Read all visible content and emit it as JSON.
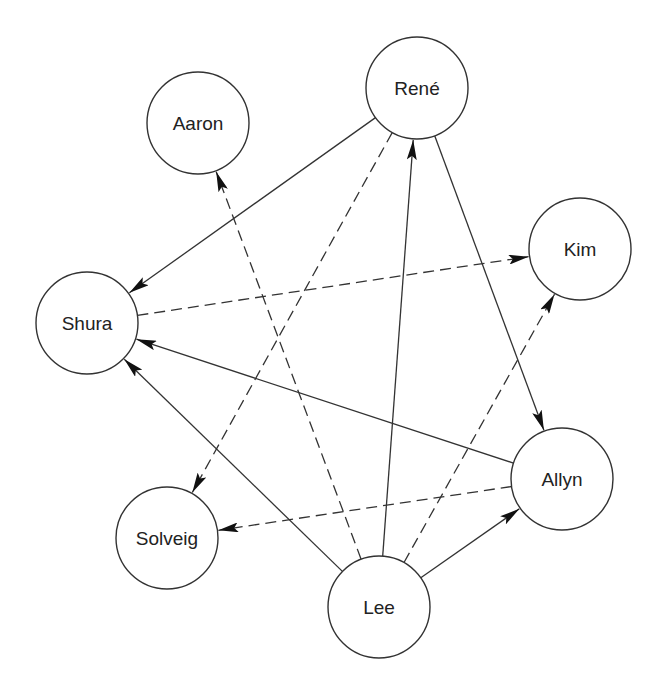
{
  "diagram": {
    "type": "directed-graph",
    "nodes": [
      {
        "id": "rene",
        "label": "René",
        "x": 417,
        "y": 88,
        "r": 51
      },
      {
        "id": "aaron",
        "label": "Aaron",
        "x": 198,
        "y": 123,
        "r": 51
      },
      {
        "id": "kim",
        "label": "Kim",
        "x": 580,
        "y": 249,
        "r": 51
      },
      {
        "id": "shura",
        "label": "Shura",
        "x": 87,
        "y": 323,
        "r": 51
      },
      {
        "id": "allyn",
        "label": "Allyn",
        "x": 562,
        "y": 479,
        "r": 51
      },
      {
        "id": "solveig",
        "label": "Solveig",
        "x": 167,
        "y": 538,
        "r": 51
      },
      {
        "id": "lee",
        "label": "Lee",
        "x": 379,
        "y": 607,
        "r": 51
      }
    ],
    "edges": [
      {
        "from": "rene",
        "to": "shura",
        "style": "solid"
      },
      {
        "from": "rene",
        "to": "solveig",
        "style": "dashed"
      },
      {
        "from": "rene",
        "to": "allyn",
        "style": "solid"
      },
      {
        "from": "lee",
        "to": "rene",
        "style": "solid"
      },
      {
        "from": "lee",
        "to": "aaron",
        "style": "dashed"
      },
      {
        "from": "lee",
        "to": "kim",
        "style": "dashed"
      },
      {
        "from": "lee",
        "to": "allyn",
        "style": "solid"
      },
      {
        "from": "lee",
        "to": "shura",
        "style": "solid"
      },
      {
        "from": "allyn",
        "to": "shura",
        "style": "solid"
      },
      {
        "from": "allyn",
        "to": "solveig",
        "style": "dashed"
      },
      {
        "from": "shura",
        "to": "kim",
        "style": "dashed"
      }
    ],
    "colors": {
      "stroke": "#333333",
      "background": "#ffffff",
      "text": "#222222"
    }
  }
}
